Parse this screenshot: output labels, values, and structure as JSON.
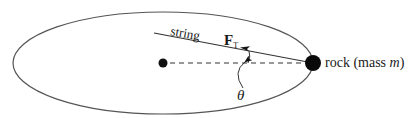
{
  "diagram": {
    "type": "physics-free-body",
    "labels": {
      "string": "string",
      "force": "F",
      "force_subscript": "T",
      "rock": "rock (mass ",
      "mass_symbol": "m",
      "rock_close": ")",
      "angle": "θ"
    },
    "colors": {
      "line": "#444444",
      "ink": "#111111",
      "background": "#ffffff"
    }
  }
}
